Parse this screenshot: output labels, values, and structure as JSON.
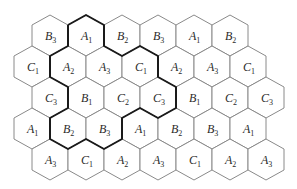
{
  "diagram": {
    "type": "hexagonal-cell-grid",
    "hex": {
      "width": 36,
      "half_height": 20.5,
      "shoulder": 10.5
    },
    "colors": {
      "cell_stroke": "#8a8a8a",
      "outline_stroke": "#1a1a1a",
      "text": "#2a2a2a",
      "background": "#ffffff"
    },
    "rows": [
      {
        "cy": 35.5,
        "cells": [
          {
            "cx": 50,
            "letter": "B",
            "sub": "3"
          },
          {
            "cx": 86,
            "letter": "A",
            "sub": "1"
          },
          {
            "cx": 122,
            "letter": "B",
            "sub": "2"
          },
          {
            "cx": 158,
            "letter": "B",
            "sub": "3"
          },
          {
            "cx": 194,
            "letter": "A",
            "sub": "1"
          },
          {
            "cx": 230,
            "letter": "B",
            "sub": "2"
          }
        ]
      },
      {
        "cy": 66.5,
        "cells": [
          {
            "cx": 32,
            "letter": "C",
            "sub": "1"
          },
          {
            "cx": 68,
            "letter": "A",
            "sub": "2"
          },
          {
            "cx": 104,
            "letter": "A",
            "sub": "3"
          },
          {
            "cx": 140,
            "letter": "C",
            "sub": "1"
          },
          {
            "cx": 176,
            "letter": "A",
            "sub": "2"
          },
          {
            "cx": 212,
            "letter": "A",
            "sub": "3"
          },
          {
            "cx": 248,
            "letter": "C",
            "sub": "1"
          }
        ]
      },
      {
        "cy": 97.5,
        "cells": [
          {
            "cx": 50,
            "letter": "C",
            "sub": "3"
          },
          {
            "cx": 86,
            "letter": "B",
            "sub": "1"
          },
          {
            "cx": 122,
            "letter": "C",
            "sub": "2"
          },
          {
            "cx": 158,
            "letter": "C",
            "sub": "3"
          },
          {
            "cx": 194,
            "letter": "B",
            "sub": "1"
          },
          {
            "cx": 230,
            "letter": "C",
            "sub": "2"
          },
          {
            "cx": 266,
            "letter": "C",
            "sub": "3"
          }
        ]
      },
      {
        "cy": 128.5,
        "cells": [
          {
            "cx": 32,
            "letter": "A",
            "sub": "1"
          },
          {
            "cx": 68,
            "letter": "B",
            "sub": "2"
          },
          {
            "cx": 104,
            "letter": "B",
            "sub": "3"
          },
          {
            "cx": 140,
            "letter": "A",
            "sub": "1"
          },
          {
            "cx": 176,
            "letter": "B",
            "sub": "2"
          },
          {
            "cx": 212,
            "letter": "B",
            "sub": "3"
          },
          {
            "cx": 248,
            "letter": "A",
            "sub": "1"
          }
        ]
      },
      {
        "cy": 159.5,
        "cells": [
          {
            "cx": 50,
            "letter": "A",
            "sub": "3"
          },
          {
            "cx": 86,
            "letter": "C",
            "sub": "1"
          },
          {
            "cx": 122,
            "letter": "A",
            "sub": "2"
          },
          {
            "cx": 158,
            "letter": "A",
            "sub": "3"
          },
          {
            "cx": 194,
            "letter": "C",
            "sub": "1"
          },
          {
            "cx": 230,
            "letter": "A",
            "sub": "2"
          },
          {
            "cx": 266,
            "letter": "A",
            "sub": "3"
          }
        ]
      }
    ],
    "cluster_outline": [
      [
        68,
        25
      ],
      [
        86,
        15
      ],
      [
        104,
        25
      ],
      [
        104,
        46
      ],
      [
        122,
        56
      ],
      [
        140,
        46
      ],
      [
        158,
        56
      ],
      [
        158,
        77
      ],
      [
        176,
        87
      ],
      [
        176,
        108
      ],
      [
        158,
        118
      ],
      [
        140,
        108
      ],
      [
        122,
        118
      ],
      [
        122,
        139
      ],
      [
        104,
        149
      ],
      [
        86,
        139
      ],
      [
        68,
        149
      ],
      [
        50,
        139
      ],
      [
        50,
        118
      ],
      [
        68,
        108
      ],
      [
        68,
        87
      ],
      [
        50,
        77
      ],
      [
        50,
        56
      ],
      [
        68,
        46
      ],
      [
        68,
        25
      ]
    ]
  }
}
